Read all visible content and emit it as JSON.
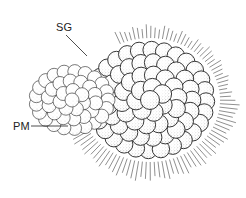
{
  "figure": {
    "labels": [
      {
        "id": "sg",
        "text": "SG",
        "x": 56,
        "y": 22,
        "leader": {
          "x1": 66,
          "y1": 35,
          "x2": 87,
          "y2": 56
        }
      },
      {
        "id": "pm",
        "text": "PM",
        "x": 13,
        "y": 121,
        "leader": {
          "x1": 31,
          "y1": 126,
          "x2": 68,
          "y2": 126
        }
      }
    ],
    "colors": {
      "ink": "#222222",
      "stipple": "#555555",
      "background": "#ffffff"
    }
  }
}
